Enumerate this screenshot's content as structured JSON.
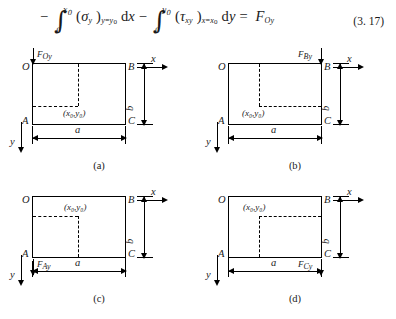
{
  "equation": {
    "number": "(3. 17)",
    "minus1": "−",
    "int1": {
      "upper": "x",
      "upper_sub": "0",
      "lower": "0"
    },
    "term1": {
      "open": "(",
      "symbol": "σ",
      "sub": "y",
      "close": ")",
      "cond": "y=y",
      "cond_sub": "0",
      "diff": "dx"
    },
    "minus2": "−",
    "int2": {
      "upper": "y",
      "upper_sub": "0",
      "lower": "0"
    },
    "term2": {
      "open": "(",
      "symbol": "τ",
      "sub": "xy",
      "close": ")",
      "cond": "x=x",
      "cond_sub": "0",
      "diff": "dy"
    },
    "equals": "=",
    "rhs": {
      "symbol": "F",
      "sub": "Oy"
    },
    "plain_text": "−∫₀^{x₀}(σ_y)_{y=y₀} dx − ∫₀^{y₀}(τ_xy)_{x=x₀} dy = F_Oy"
  },
  "figures": [
    {
      "id": "a",
      "caption": "(a)",
      "corners": {
        "top_left": "O",
        "top_right": "B",
        "bottom_left": "A",
        "bottom_right": "C"
      },
      "point_label": "(x₀,y₀)",
      "point_label_position": "inside-below-right",
      "force": {
        "label": "F",
        "sub": "Oy",
        "at_corner": "O",
        "direction": "down"
      },
      "dim_width": "a",
      "dim_height": "b",
      "axis_x": "x",
      "axis_y": "y"
    },
    {
      "id": "b",
      "caption": "(b)",
      "corners": {
        "top_left": "O",
        "top_right": "B",
        "bottom_left": "A",
        "bottom_right": "C"
      },
      "point_label": "(x₀,y₀)",
      "point_label_position": "inside-below-left",
      "force": {
        "label": "F",
        "sub": "By",
        "at_corner": "B",
        "direction": "down"
      },
      "dim_width": "a",
      "dim_height": "b",
      "axis_x": "x",
      "axis_y": "y"
    },
    {
      "id": "c",
      "caption": "(c)",
      "corners": {
        "top_left": "O",
        "top_right": "B",
        "bottom_left": "A",
        "bottom_right": "C"
      },
      "point_label": "(x₀,y₀)",
      "point_label_position": "inside-above-right",
      "force": {
        "label": "F",
        "sub": "Ay",
        "at_corner": "A",
        "direction": "down"
      },
      "dim_width": "a",
      "dim_height": "b",
      "axis_x": "x",
      "axis_y": "y"
    },
    {
      "id": "d",
      "caption": "(d)",
      "corners": {
        "top_left": "O",
        "top_right": "B",
        "bottom_left": "A",
        "bottom_right": "C"
      },
      "point_label": "(x₀,y₀)",
      "point_label_position": "inside-above-left",
      "force": {
        "label": "F",
        "sub": "Cy",
        "at_corner": "C",
        "direction": "down"
      },
      "dim_width": "a",
      "dim_height": "b",
      "axis_x": "x",
      "axis_y": "y"
    }
  ]
}
